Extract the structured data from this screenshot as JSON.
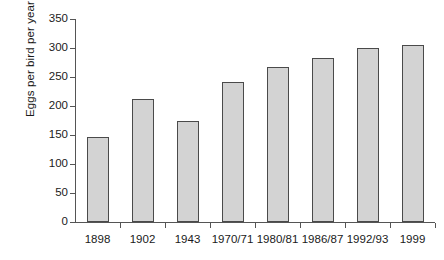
{
  "chart_data": {
    "type": "bar",
    "title": "",
    "xlabel": "",
    "ylabel": "Eggs per bird per year",
    "categories": [
      "1898",
      "1902",
      "1943",
      "1970/71",
      "1980/81",
      "1986/87",
      "1992/93",
      "1999"
    ],
    "values": [
      147,
      212,
      175,
      241,
      268,
      283,
      300,
      306
    ],
    "yticks": [
      0,
      50,
      100,
      150,
      200,
      250,
      300,
      350
    ],
    "ytick_labels": [
      "0",
      "50",
      "100",
      "150",
      "200",
      "250",
      "300",
      "350"
    ],
    "ylim": [
      0,
      350
    ],
    "grid": false,
    "legend": null,
    "bar_fill_color": "#d3d3d3",
    "bar_border_color": "#4a4a4a",
    "axis_color": "#555555",
    "background_color": "#ffffff"
  }
}
